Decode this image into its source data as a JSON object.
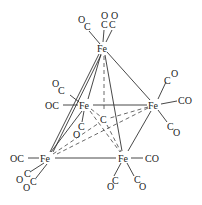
{
  "diagram": {
    "type": "chemical-structure",
    "colors": {
      "line": "#333333",
      "text": "#222222",
      "background": "#ffffff"
    },
    "atoms": {
      "fe_top": {
        "label": "Fe",
        "x": 103,
        "y": 48
      },
      "fe_mid_left": {
        "label": "Fe",
        "x": 85,
        "y": 105
      },
      "fe_mid_right": {
        "label": "Fe",
        "x": 154,
        "y": 105
      },
      "fe_bot_left": {
        "label": "Fe",
        "x": 46,
        "y": 158
      },
      "fe_bot_right": {
        "label": "Fe",
        "x": 124,
        "y": 158
      },
      "c_center": {
        "label": "C",
        "x": 104,
        "y": 119
      }
    },
    "ligands": {
      "top_oc_left": {
        "o": "O",
        "c": "C"
      },
      "top_co_1": {
        "o": "O",
        "c": "C"
      },
      "top_co_2": {
        "o": "O",
        "c": "C"
      },
      "mid_left_oc_up": {
        "o": "O",
        "c": "C"
      },
      "mid_left_oc": "OC",
      "mid_left_co_down": {
        "o": "O",
        "c": "C"
      },
      "mid_right_co_up": {
        "o": "O",
        "c": "C"
      },
      "mid_right_co": "CO",
      "mid_right_co_down": {
        "o": "O",
        "c": "C"
      },
      "bot_left_oc": "OC",
      "bot_left_co_1": {
        "o": "O",
        "c": "C"
      },
      "bot_left_co_2": {
        "o": "O",
        "c": "C"
      },
      "bot_right_co": "CO",
      "bot_right_co_1": {
        "o": "O",
        "c": "C"
      },
      "bot_right_co_2": {
        "o": "O",
        "c": "C"
      }
    }
  }
}
